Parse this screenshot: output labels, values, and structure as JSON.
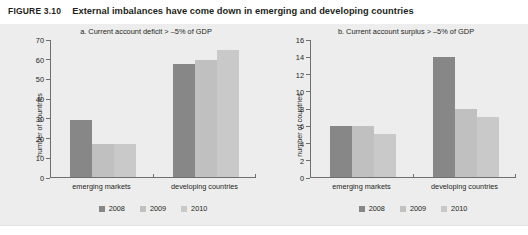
{
  "figure": {
    "tag": "FIGURE 3.10",
    "title": "External imbalances have come down in emerging and developing countries"
  },
  "colors": {
    "panel_bg": "#ededed",
    "series_2008": "#878787",
    "series_2009": "#c0c0c0",
    "series_2010": "#c9c9c9",
    "axis": "#6f6f6f",
    "text": "#231f20"
  },
  "legend": {
    "items": [
      {
        "label": "2008",
        "color": "#878787"
      },
      {
        "label": "2009",
        "color": "#c0c0c0"
      },
      {
        "label": "2010",
        "color": "#c9c9c9"
      }
    ]
  },
  "chart_data": [
    {
      "type": "bar",
      "panel": "a",
      "title": "a.  Current account deficit > –5% of GDP",
      "xlabel": "",
      "ylabel": "number of countries",
      "categories": [
        "emerging markets",
        "developing countries"
      ],
      "ylim": [
        0,
        70
      ],
      "yticks": [
        0,
        10,
        20,
        30,
        40,
        50,
        60,
        70
      ],
      "ytick_labels": [
        "0",
        "10",
        "20",
        "30",
        "40",
        "50",
        "60",
        "70"
      ],
      "grid": false,
      "legend_position": "bottom",
      "series": [
        {
          "name": "2008",
          "color": "#878787",
          "values": [
            29,
            58
          ]
        },
        {
          "name": "2009",
          "color": "#c0c0c0",
          "values": [
            17,
            60
          ]
        },
        {
          "name": "2010",
          "color": "#c9c9c9",
          "values": [
            17,
            65
          ]
        }
      ]
    },
    {
      "type": "bar",
      "panel": "b",
      "title": "b.  Current account surplus > –5%  of GDP",
      "xlabel": "",
      "ylabel": "number of countries",
      "categories": [
        "emerging markets",
        "developing countries"
      ],
      "ylim": [
        0,
        16
      ],
      "yticks": [
        0,
        2,
        4,
        6,
        8,
        10,
        12,
        14,
        16
      ],
      "ytick_labels": [
        "0",
        "2",
        "4",
        "6",
        "8",
        "10",
        "12",
        "14",
        "16"
      ],
      "grid": false,
      "legend_position": "bottom",
      "series": [
        {
          "name": "2008",
          "color": "#878787",
          "values": [
            6,
            14
          ]
        },
        {
          "name": "2009",
          "color": "#c0c0c0",
          "values": [
            6,
            8
          ]
        },
        {
          "name": "2010",
          "color": "#c9c9c9",
          "values": [
            5,
            7
          ]
        }
      ]
    }
  ]
}
